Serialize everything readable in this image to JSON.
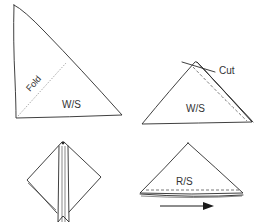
{
  "diagram": {
    "steps": [
      {
        "id": "step1",
        "description": "Triangle folded, wrong side up, with fold line",
        "labels": {
          "fold": "Fold",
          "side": "W/S"
        }
      },
      {
        "id": "step2",
        "description": "Triangle with folded edge and cut mark at apex",
        "labels": {
          "cut": "Cut",
          "side": "W/S"
        }
      },
      {
        "id": "step3",
        "description": "Diamond shape with center vertical strip (opened piece)"
      },
      {
        "id": "step4",
        "description": "Triangle right side up with stitched hem and direction arrow",
        "labels": {
          "side": "R/S"
        },
        "arrow": "right"
      }
    ],
    "colors": {
      "line": "#2a2a2a",
      "fold_line": "#777777",
      "text": "#333333",
      "background": "#ffffff"
    }
  }
}
